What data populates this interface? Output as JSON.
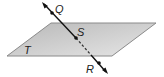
{
  "diagram": {
    "type": "geometry",
    "plane": {
      "label": "T",
      "fill_light": "#e4e4e4",
      "fill_dark": "#b4b4b4",
      "edge": "#888888"
    },
    "points": [
      {
        "label": "Q"
      },
      {
        "label": "S"
      },
      {
        "label": "R"
      }
    ],
    "line_color": "#111111"
  }
}
